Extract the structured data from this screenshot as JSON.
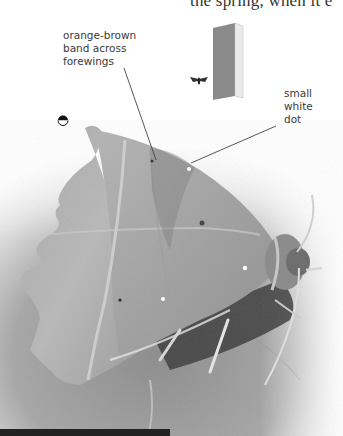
{
  "page": {
    "body_text_fragment": "the spring, when it e",
    "accent_colors": {
      "text": "#3a3a3a",
      "leader_line": "#444444",
      "background": "#ffffff"
    }
  },
  "photo": {
    "subject": "moth-photo",
    "style": "grayscale"
  },
  "annotations": [
    {
      "id": "band",
      "text": "orange-brown\nband across\nforewings"
    },
    {
      "id": "dot",
      "text": "small\nwhite\ndot"
    }
  ],
  "icons": {
    "season_icon": "half-filled-circle-icon",
    "size_icon": "book-icon",
    "size_reference": "small-moth-icon"
  }
}
